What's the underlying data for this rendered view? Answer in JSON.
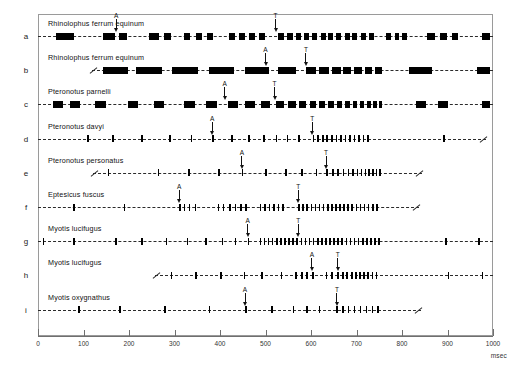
{
  "figure": {
    "axis": {
      "label": "msec",
      "min": 0,
      "max": 1000,
      "tick_step": 100,
      "ticks": [
        0,
        100,
        200,
        300,
        400,
        500,
        600,
        700,
        800,
        900,
        1000
      ],
      "tick_labels": [
        "0",
        "100",
        "200",
        "300",
        "400",
        "500",
        "600",
        "700",
        "800",
        "900",
        "1000"
      ]
    },
    "marker_legend": {
      "approach_label": "A",
      "terminal_label": "T"
    },
    "colors": {
      "pulse": "#000000",
      "baseline": "#2b2b2b",
      "frame": "#9a9a9a",
      "text": "#111111"
    }
  },
  "chart_data": {
    "type": "raster",
    "xlabel": "msec",
    "ylabel": "",
    "xlim": [
      0,
      1000
    ],
    "grid": false,
    "legend": "none",
    "rows": [
      {
        "letter": "a",
        "species": "Rhinolophus ferrum equinum",
        "style": "wide",
        "start_open": true,
        "end_open": false,
        "markers": [
          {
            "label": "A",
            "x": 172
          },
          {
            "label": "T",
            "x": 522
          }
        ],
        "pulses": [
          {
            "x": 40,
            "w": 40
          },
          {
            "x": 143,
            "w": 27
          },
          {
            "x": 179,
            "w": 16
          },
          {
            "x": 244,
            "w": 22
          },
          {
            "x": 277,
            "w": 15
          },
          {
            "x": 320,
            "w": 15
          },
          {
            "x": 347,
            "w": 13
          },
          {
            "x": 371,
            "w": 13
          },
          {
            "x": 419,
            "w": 14
          },
          {
            "x": 442,
            "w": 14
          },
          {
            "x": 464,
            "w": 13
          },
          {
            "x": 486,
            "w": 12
          },
          {
            "x": 528,
            "w": 12
          },
          {
            "x": 548,
            "w": 12
          },
          {
            "x": 567,
            "w": 11
          },
          {
            "x": 585,
            "w": 11
          },
          {
            "x": 603,
            "w": 11
          },
          {
            "x": 621,
            "w": 11
          },
          {
            "x": 638,
            "w": 11
          },
          {
            "x": 656,
            "w": 11
          },
          {
            "x": 674,
            "w": 11
          },
          {
            "x": 691,
            "w": 11
          },
          {
            "x": 709,
            "w": 11
          },
          {
            "x": 727,
            "w": 11
          },
          {
            "x": 765,
            "w": 11
          },
          {
            "x": 785,
            "w": 9
          },
          {
            "x": 801,
            "w": 10
          },
          {
            "x": 856,
            "w": 16
          },
          {
            "x": 883,
            "w": 15
          },
          {
            "x": 910,
            "w": 13
          },
          {
            "x": 975,
            "w": 18
          }
        ]
      },
      {
        "letter": "b",
        "species": "Rhinolophus ferrum equinum",
        "style": "wide",
        "start_open": false,
        "end_open": false,
        "break_at": 118,
        "markers": [
          {
            "label": "A",
            "x": 500
          },
          {
            "label": "T",
            "x": 589
          }
        ],
        "pulses": [
          {
            "x": 142,
            "w": 56
          },
          {
            "x": 215,
            "w": 58
          },
          {
            "x": 295,
            "w": 56
          },
          {
            "x": 375,
            "w": 56
          },
          {
            "x": 455,
            "w": 53
          },
          {
            "x": 527,
            "w": 40
          },
          {
            "x": 589,
            "w": 23
          },
          {
            "x": 618,
            "w": 21
          },
          {
            "x": 646,
            "w": 19
          },
          {
            "x": 671,
            "w": 18
          },
          {
            "x": 695,
            "w": 17
          },
          {
            "x": 718,
            "w": 16
          },
          {
            "x": 740,
            "w": 16
          },
          {
            "x": 815,
            "w": 50
          },
          {
            "x": 965,
            "w": 28
          }
        ]
      },
      {
        "letter": "c",
        "species": "Pteronotus  parnelli",
        "style": "wide",
        "start_open": true,
        "end_open": false,
        "markers": [
          {
            "label": "A",
            "x": 410
          },
          {
            "label": "T",
            "x": 520
          }
        ],
        "pulses": [
          {
            "x": 33,
            "w": 22
          },
          {
            "x": 70,
            "w": 23
          },
          {
            "x": 125,
            "w": 24
          },
          {
            "x": 197,
            "w": 22
          },
          {
            "x": 255,
            "w": 22
          },
          {
            "x": 320,
            "w": 24
          },
          {
            "x": 369,
            "w": 24
          },
          {
            "x": 417,
            "w": 22
          },
          {
            "x": 455,
            "w": 21
          },
          {
            "x": 490,
            "w": 19
          },
          {
            "x": 523,
            "w": 17
          },
          {
            "x": 550,
            "w": 16
          },
          {
            "x": 574,
            "w": 15
          },
          {
            "x": 597,
            "w": 14
          },
          {
            "x": 618,
            "w": 13
          },
          {
            "x": 638,
            "w": 12
          },
          {
            "x": 657,
            "w": 12
          },
          {
            "x": 675,
            "w": 11
          },
          {
            "x": 692,
            "w": 10
          },
          {
            "x": 708,
            "w": 9
          },
          {
            "x": 723,
            "w": 8
          },
          {
            "x": 737,
            "w": 7
          },
          {
            "x": 749,
            "w": 6
          },
          {
            "x": 830,
            "w": 22
          },
          {
            "x": 880,
            "w": 22
          },
          {
            "x": 975,
            "w": 18
          }
        ]
      },
      {
        "letter": "d",
        "species": "Pteronotus davyi",
        "style": "thin",
        "start_open": true,
        "end_open": true,
        "markers": [
          {
            "label": "A",
            "x": 383
          },
          {
            "label": "T",
            "x": 603
          }
        ],
        "pulses": [
          {
            "x": 108
          },
          {
            "x": 163
          },
          {
            "x": 227
          },
          {
            "x": 288
          },
          {
            "x": 336
          },
          {
            "x": 383
          },
          {
            "x": 424
          },
          {
            "x": 462
          },
          {
            "x": 495
          },
          {
            "x": 522
          },
          {
            "x": 547
          },
          {
            "x": 572
          },
          {
            "x": 604
          },
          {
            "x": 614
          },
          {
            "x": 624
          },
          {
            "x": 634
          },
          {
            "x": 644
          },
          {
            "x": 654
          },
          {
            "x": 664
          },
          {
            "x": 674
          },
          {
            "x": 684
          },
          {
            "x": 694
          },
          {
            "x": 704
          },
          {
            "x": 714
          },
          {
            "x": 724
          },
          {
            "x": 890
          }
        ]
      },
      {
        "letter": "e",
        "species": "Pteronotus personatus",
        "style": "thin",
        "start_open": false,
        "end_open": true,
        "break_at": 120,
        "markers": [
          {
            "label": "A",
            "x": 448
          },
          {
            "label": "T",
            "x": 633
          }
        ],
        "pulses": [
          {
            "x": 153
          },
          {
            "x": 263
          },
          {
            "x": 330
          },
          {
            "x": 396
          },
          {
            "x": 448
          },
          {
            "x": 499
          },
          {
            "x": 543
          },
          {
            "x": 578
          },
          {
            "x": 610
          },
          {
            "x": 634
          },
          {
            "x": 646
          },
          {
            "x": 658
          },
          {
            "x": 670
          },
          {
            "x": 681
          },
          {
            "x": 691
          },
          {
            "x": 700
          },
          {
            "x": 709
          },
          {
            "x": 718
          },
          {
            "x": 726
          },
          {
            "x": 734
          },
          {
            "x": 742
          },
          {
            "x": 750
          }
        ]
      },
      {
        "letter": "f",
        "species": "Eptesicus fuscus",
        "style": "thin",
        "start_open": true,
        "end_open": true,
        "markers": [
          {
            "label": "A",
            "x": 310
          },
          {
            "label": "T",
            "x": 572
          }
        ],
        "pulses": [
          {
            "x": 78
          },
          {
            "x": 188
          },
          {
            "x": 310
          },
          {
            "x": 320
          },
          {
            "x": 331
          },
          {
            "x": 344
          },
          {
            "x": 395
          },
          {
            "x": 406
          },
          {
            "x": 420
          },
          {
            "x": 432
          },
          {
            "x": 444
          },
          {
            "x": 456
          },
          {
            "x": 487
          },
          {
            "x": 497
          },
          {
            "x": 507
          },
          {
            "x": 517
          },
          {
            "x": 527
          },
          {
            "x": 537
          },
          {
            "x": 572
          },
          {
            "x": 581
          },
          {
            "x": 590
          },
          {
            "x": 599
          },
          {
            "x": 608
          },
          {
            "x": 617
          },
          {
            "x": 626
          },
          {
            "x": 635
          },
          {
            "x": 644
          },
          {
            "x": 653
          },
          {
            "x": 662
          },
          {
            "x": 671
          },
          {
            "x": 680
          },
          {
            "x": 689
          },
          {
            "x": 698
          },
          {
            "x": 707
          },
          {
            "x": 716
          },
          {
            "x": 725
          },
          {
            "x": 734
          },
          {
            "x": 743
          }
        ]
      },
      {
        "letter": "g",
        "species": "Myotis lucifugus",
        "style": "thin",
        "start_open": false,
        "end_open": false,
        "markers": [
          {
            "label": "A",
            "x": 461
          },
          {
            "label": "T",
            "x": 572
          }
        ],
        "pulses": [
          {
            "x": 10
          },
          {
            "x": 78
          },
          {
            "x": 170
          },
          {
            "x": 227
          },
          {
            "x": 281
          },
          {
            "x": 327
          },
          {
            "x": 367
          },
          {
            "x": 404
          },
          {
            "x": 432
          },
          {
            "x": 461
          },
          {
            "x": 487
          },
          {
            "x": 496
          },
          {
            "x": 505
          },
          {
            "x": 514
          },
          {
            "x": 523
          },
          {
            "x": 532
          },
          {
            "x": 541
          },
          {
            "x": 550
          },
          {
            "x": 559
          },
          {
            "x": 568
          },
          {
            "x": 577
          },
          {
            "x": 586
          },
          {
            "x": 595
          },
          {
            "x": 604
          },
          {
            "x": 613
          },
          {
            "x": 622
          },
          {
            "x": 631
          },
          {
            "x": 640
          },
          {
            "x": 649
          },
          {
            "x": 658
          },
          {
            "x": 667
          },
          {
            "x": 676
          },
          {
            "x": 685
          },
          {
            "x": 694
          },
          {
            "x": 703
          },
          {
            "x": 712
          },
          {
            "x": 721
          },
          {
            "x": 730
          },
          {
            "x": 739
          },
          {
            "x": 748
          },
          {
            "x": 895
          },
          {
            "x": 968
          }
        ]
      },
      {
        "letter": "h",
        "species": "Myotis lucifugus",
        "style": "thin",
        "start_open": false,
        "end_open": false,
        "break_at": 258,
        "markers": [
          {
            "label": "A",
            "x": 602
          },
          {
            "label": "T",
            "x": 659
          }
        ],
        "pulses": [
          {
            "x": 292
          },
          {
            "x": 345
          },
          {
            "x": 400
          },
          {
            "x": 452
          },
          {
            "x": 490
          },
          {
            "x": 533
          },
          {
            "x": 565
          },
          {
            "x": 578
          },
          {
            "x": 590
          },
          {
            "x": 602
          },
          {
            "x": 632
          },
          {
            "x": 645
          },
          {
            "x": 657
          },
          {
            "x": 668
          },
          {
            "x": 678
          },
          {
            "x": 688
          },
          {
            "x": 697
          },
          {
            "x": 706
          },
          {
            "x": 715
          },
          {
            "x": 724
          },
          {
            "x": 733
          },
          {
            "x": 742
          },
          {
            "x": 900
          },
          {
            "x": 975
          }
        ]
      },
      {
        "letter": "i",
        "species": "Myotis oxygnathus",
        "style": "thin",
        "start_open": true,
        "end_open": true,
        "markers": [
          {
            "label": "A",
            "x": 455
          },
          {
            "label": "T",
            "x": 657
          }
        ],
        "pulses": [
          {
            "x": 88
          },
          {
            "x": 178
          },
          {
            "x": 277
          },
          {
            "x": 375
          },
          {
            "x": 455
          },
          {
            "x": 513
          },
          {
            "x": 560
          },
          {
            "x": 590
          },
          {
            "x": 617
          },
          {
            "x": 655
          },
          {
            "x": 668
          },
          {
            "x": 681
          },
          {
            "x": 694
          },
          {
            "x": 707
          },
          {
            "x": 720
          },
          {
            "x": 733
          },
          {
            "x": 746
          }
        ]
      }
    ]
  }
}
